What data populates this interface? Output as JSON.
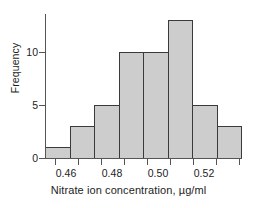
{
  "chart_data": {
    "type": "bar",
    "title": "",
    "xlabel": "Nitrate ion concentration, µg/ml",
    "ylabel": "Frequency",
    "bin_edges": [
      0.455,
      0.46,
      0.465,
      0.47,
      0.475,
      0.48,
      0.485,
      0.49,
      0.495
    ],
    "categories": [
      "0.455-0.460",
      "0.460-0.465",
      "0.465-0.470",
      "0.470-0.475",
      "0.475-0.480",
      "0.480-0.485",
      "0.485-0.490",
      "0.490-0.495"
    ],
    "values": [
      1,
      3,
      5,
      10,
      10,
      13,
      5,
      3
    ],
    "x_tick_labels": [
      "0.46",
      "0.48",
      "0.50",
      "0.52"
    ],
    "y_tick_labels": [
      "0",
      "5",
      "10"
    ],
    "y_ticks": [
      0,
      5,
      10
    ],
    "ylim": [
      0,
      13.6
    ],
    "grid": false,
    "legend": "none",
    "bar_fill_color": "#cdcdcd",
    "bar_border_color": "#3a3a3a",
    "axis_color": "#555555"
  },
  "axes": {
    "y_title": "Frequency",
    "x_title": "Nitrate ion concentration, µg/ml",
    "y_tick_0": "0",
    "y_tick_1": "5",
    "y_tick_2": "10",
    "x_tick_0": "0.46",
    "x_tick_1": "0.48",
    "x_tick_2": "0.50",
    "x_tick_3": "0.52"
  }
}
